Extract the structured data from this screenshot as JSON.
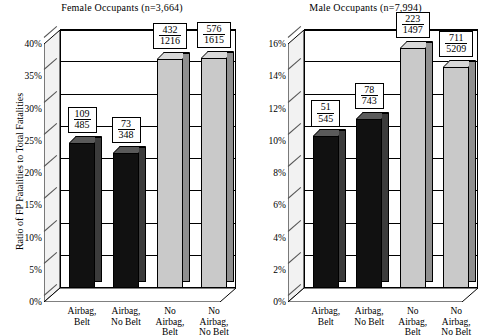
{
  "chart_data": [
    {
      "type": "bar",
      "title": "Female Occupants (n=3,664)",
      "ylabel": "Ratio of FP Fatalities to Total Fatalities",
      "xlabel": "",
      "categories": [
        "Airbag, Belt",
        "Airbag, No Belt",
        "No Airbag, Belt",
        "No Airbag, No Belt"
      ],
      "category_lines": [
        [
          "Airbag,",
          "Belt"
        ],
        [
          "Airbag,",
          "No Belt"
        ],
        [
          "No",
          "Airbag,",
          "Belt"
        ],
        [
          "No",
          "Airbag,",
          "No Belt"
        ]
      ],
      "values": [
        22.5,
        21.0,
        35.5,
        35.7
      ],
      "labels": [
        {
          "numerator": "109",
          "denominator": "485"
        },
        {
          "numerator": "73",
          "denominator": "348"
        },
        {
          "numerator": "432",
          "denominator": "1216"
        },
        {
          "numerator": "576",
          "denominator": "1615"
        }
      ],
      "bar_colors": [
        "#111111",
        "#111111",
        "#c9c9c9",
        "#c9c9c9"
      ],
      "ylim": [
        0,
        40
      ],
      "ytick_step": 5,
      "ytick_labels": [
        "0%",
        "5%",
        "10%",
        "15%",
        "20%",
        "25%",
        "30%",
        "35%",
        "40%"
      ],
      "grid": true,
      "legend": "none"
    },
    {
      "type": "bar",
      "title": "Male Occupants (n=7,994)",
      "ylabel": "",
      "xlabel": "",
      "categories": [
        "Airbag, Belt",
        "Airbag, No Belt",
        "No Airbag, Belt",
        "No Airbag, No Belt"
      ],
      "category_lines": [
        [
          "Airbag,",
          "Belt"
        ],
        [
          "Airbag,",
          "No Belt"
        ],
        [
          "No",
          "Airbag,",
          "Belt"
        ],
        [
          "No",
          "Airbag,",
          "No Belt"
        ]
      ],
      "values": [
        9.4,
        10.5,
        14.9,
        13.7
      ],
      "labels": [
        {
          "numerator": "51",
          "denominator": "545"
        },
        {
          "numerator": "78",
          "denominator": "743"
        },
        {
          "numerator": "223",
          "denominator": "1497"
        },
        {
          "numerator": "711",
          "denominator": "5209"
        }
      ],
      "bar_colors": [
        "#111111",
        "#111111",
        "#c9c9c9",
        "#c9c9c9"
      ],
      "ylim": [
        0,
        16
      ],
      "ytick_step": 2,
      "ytick_labels": [
        "0%",
        "2%",
        "4%",
        "6%",
        "8%",
        "10%",
        "12%",
        "14%",
        "16%"
      ],
      "grid": true,
      "legend": "none"
    }
  ],
  "female": {
    "title": "Female Occupants (n=3,664)",
    "ylabel": "Ratio of FP Fatalities to Total Fatalities",
    "yticks": [
      "0%",
      "5%",
      "10%",
      "15%",
      "20%",
      "25%",
      "30%",
      "35%",
      "40%"
    ],
    "bars": [
      {
        "cat_line1": "Airbag,",
        "cat_line2": "Belt",
        "cat_line3": "",
        "num": "109",
        "den": "485",
        "value": 22.5
      },
      {
        "cat_line1": "Airbag,",
        "cat_line2": "No Belt",
        "cat_line3": "",
        "num": "73",
        "den": "348",
        "value": 21.0
      },
      {
        "cat_line1": "No",
        "cat_line2": "Airbag,",
        "cat_line3": "Belt",
        "num": "432",
        "den": "1216",
        "value": 35.5
      },
      {
        "cat_line1": "No",
        "cat_line2": "Airbag,",
        "cat_line3": "No Belt",
        "num": "576",
        "den": "1615",
        "value": 35.7
      }
    ]
  },
  "male": {
    "title": "Male Occupants (n=7,994)",
    "ylabel": "",
    "yticks": [
      "0%",
      "2%",
      "4%",
      "6%",
      "8%",
      "10%",
      "12%",
      "14%",
      "16%"
    ],
    "bars": [
      {
        "cat_line1": "Airbag,",
        "cat_line2": "Belt",
        "cat_line3": "",
        "num": "51",
        "den": "545",
        "value": 9.4
      },
      {
        "cat_line1": "Airbag,",
        "cat_line2": "No Belt",
        "cat_line3": "",
        "num": "78",
        "den": "743",
        "value": 10.5
      },
      {
        "cat_line1": "No",
        "cat_line2": "Airbag,",
        "cat_line3": "Belt",
        "num": "223",
        "den": "1497",
        "value": 14.9
      },
      {
        "cat_line1": "No",
        "cat_line2": "Airbag,",
        "cat_line3": "No Belt",
        "num": "711",
        "den": "5209",
        "value": 13.7
      }
    ]
  },
  "colors": {
    "bar_dark": "#111111",
    "bar_light": "#c9c9c9",
    "axis": "#000000",
    "background": "#ffffff"
  }
}
